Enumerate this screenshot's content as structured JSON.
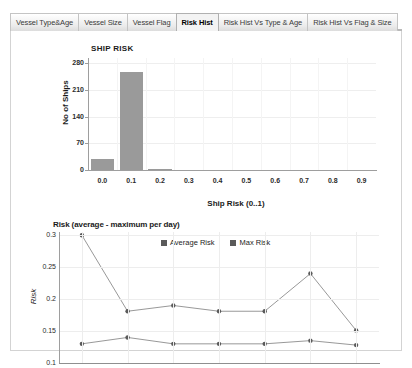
{
  "tabs": [
    {
      "label": "Vessel Type&Age",
      "active": false
    },
    {
      "label": "Vessel Size",
      "active": false
    },
    {
      "label": "Vessel Flag",
      "active": false
    },
    {
      "label": "Risk Hist",
      "active": true
    },
    {
      "label": "Risk Hist Vs Type & Age",
      "active": false
    },
    {
      "label": "Risk Hist Vs Flag & Size",
      "active": false
    }
  ],
  "colors": {
    "bar_fill": "#9a9a9a",
    "line_stroke": "#8c8c8c",
    "marker_fill": "#5a5a5a",
    "axis": "#9e9e9e",
    "grid": "#ededed",
    "panel_border": "#d3d3d3",
    "text": "#1a1a1a"
  },
  "chart_data": [
    {
      "type": "bar",
      "title": "SHIP RISK",
      "xlabel": "Ship Risk (0..1)",
      "ylabel": "No of Ships",
      "categories": [
        "0.0",
        "0.1",
        "0.2",
        "0.3",
        "0.4",
        "0.5",
        "0.6",
        "0.7",
        "0.8",
        "0.9"
      ],
      "values": [
        28,
        258,
        1,
        0,
        0,
        0,
        0,
        0,
        0,
        0
      ],
      "ylim": [
        0,
        294
      ],
      "yticks": [
        0,
        70,
        140,
        210,
        280
      ],
      "ytick_labels": [
        "0",
        "70",
        "140",
        "210",
        "280"
      ],
      "grid": true,
      "legend": null
    },
    {
      "type": "line",
      "title": "Risk (average - maximum per day)",
      "xlabel": "",
      "ylabel": "Risk",
      "x": [
        "01-Jul-2009",
        "02-Jul-2009",
        "03-Jul-2009",
        "04-Jul-2009",
        "05-Jul-2009",
        "06-Jul-2009",
        "07-Jul-2009"
      ],
      "series": [
        {
          "name": "Average Risk",
          "values": [
            0.13,
            0.14,
            0.13,
            0.13,
            0.13,
            0.135,
            0.128
          ]
        },
        {
          "name": "Max Risk",
          "values": [
            0.3,
            0.181,
            0.19,
            0.181,
            0.181,
            0.24,
            0.151
          ]
        }
      ],
      "ylim": [
        0.1,
        0.305
      ],
      "yticks": [
        0.1,
        0.15,
        0.2,
        0.25,
        0.3
      ],
      "ytick_labels": [
        "0.1",
        "0.15",
        "0.2",
        "0.25",
        "0.3"
      ],
      "grid": true,
      "legend_position": "top-right",
      "legend_entries": [
        "Average Risk",
        "Max Risk"
      ]
    }
  ]
}
